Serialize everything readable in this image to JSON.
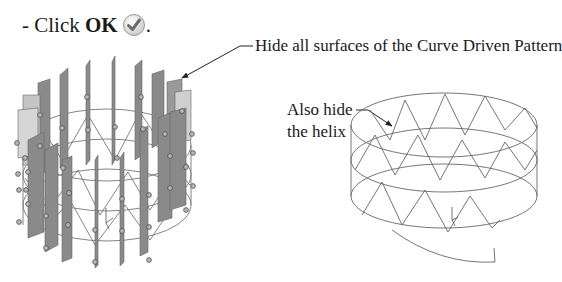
{
  "instruction": {
    "prefix": "- Click ",
    "button": "OK",
    "suffix": ".",
    "icon": "ok-checkmark-icon"
  },
  "callouts": [
    {
      "text": "Hide all surfaces of the Curve Driven Pattern"
    },
    {
      "line1": "Also hide",
      "line2": "the helix"
    }
  ],
  "figures": {
    "left": "Curve Driven Pattern with surfaces shown",
    "right": "Helix and cylinder wireframe"
  },
  "colors": {
    "text": "#1a1a1a",
    "surface": "#8a8a8a",
    "surface_light": "#c4c4c4",
    "wire": "#555555"
  }
}
